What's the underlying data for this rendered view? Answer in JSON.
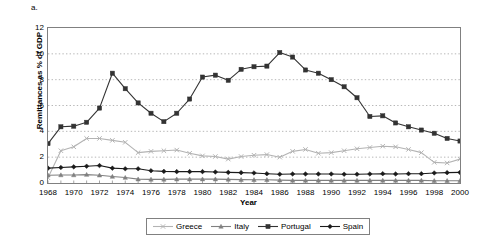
{
  "panel_label": "a.",
  "chart_data": {
    "type": "line",
    "title": "",
    "xlabel": "Year",
    "ylabel": "Remittances as % of GDP",
    "xlim": [
      1968,
      2000
    ],
    "ylim": [
      0,
      12
    ],
    "ytick_step": 2,
    "xtick_step": 2,
    "grid": true,
    "grid_style": "dotted-horizontal",
    "legend_position": "bottom-center",
    "x": [
      1968,
      1969,
      1970,
      1971,
      1972,
      1973,
      1974,
      1975,
      1976,
      1977,
      1978,
      1979,
      1980,
      1981,
      1982,
      1983,
      1984,
      1985,
      1986,
      1987,
      1988,
      1989,
      1990,
      1991,
      1992,
      1993,
      1994,
      1995,
      1996,
      1997,
      1998,
      1999,
      2000
    ],
    "ytick_labels": [
      "0",
      "2",
      "4",
      "6",
      "8",
      "10",
      "12"
    ],
    "xtick_labels": [
      "1968",
      "1970",
      "1972",
      "1974",
      "1976",
      "1978",
      "1980",
      "1982",
      "1984",
      "1986",
      "1988",
      "1990",
      "1992",
      "1994",
      "1996",
      "1998",
      "2000"
    ],
    "series": [
      {
        "name": "Greece",
        "color": "#b3b3b3",
        "marker": "x",
        "values": [
          0.4,
          2.5,
          2.8,
          3.45,
          3.45,
          3.3,
          3.15,
          2.35,
          2.45,
          2.5,
          2.55,
          2.3,
          2.1,
          2.05,
          1.85,
          2.05,
          2.15,
          2.2,
          2.0,
          2.45,
          2.6,
          2.3,
          2.35,
          2.5,
          2.65,
          2.75,
          2.85,
          2.8,
          2.6,
          2.35,
          1.6,
          1.55,
          1.85
        ]
      },
      {
        "name": "Italy",
        "color": "#808080",
        "marker": "triangle",
        "values": [
          0.6,
          0.62,
          0.62,
          0.65,
          0.6,
          0.5,
          0.42,
          0.3,
          0.28,
          0.28,
          0.3,
          0.3,
          0.3,
          0.3,
          0.28,
          0.26,
          0.25,
          0.25,
          0.22,
          0.2,
          0.2,
          0.2,
          0.2,
          0.2,
          0.2,
          0.2,
          0.2,
          0.2,
          0.2,
          0.2,
          0.18,
          0.18,
          0.18
        ]
      },
      {
        "name": "Portugal",
        "color": "#333333",
        "marker": "square",
        "values": [
          3.05,
          4.35,
          4.4,
          4.7,
          5.8,
          8.5,
          7.3,
          6.2,
          5.4,
          4.75,
          5.4,
          6.5,
          8.2,
          8.35,
          7.95,
          8.8,
          9.0,
          9.05,
          10.1,
          9.75,
          8.75,
          8.5,
          8.0,
          7.45,
          6.6,
          5.15,
          5.2,
          4.65,
          4.35,
          4.1,
          3.85,
          3.45,
          3.25
        ]
      },
      {
        "name": "Spain",
        "color": "#1a1a1a",
        "marker": "diamond",
        "values": [
          1.15,
          1.2,
          1.25,
          1.3,
          1.35,
          1.15,
          1.1,
          1.1,
          0.95,
          0.9,
          0.88,
          0.88,
          0.88,
          0.85,
          0.82,
          0.8,
          0.78,
          0.72,
          0.68,
          0.7,
          0.7,
          0.7,
          0.7,
          0.68,
          0.68,
          0.7,
          0.72,
          0.7,
          0.72,
          0.72,
          0.78,
          0.8,
          0.82
        ]
      }
    ]
  }
}
